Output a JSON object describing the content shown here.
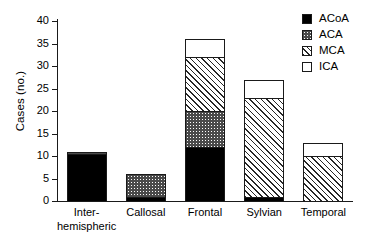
{
  "chart_data": {
    "type": "bar",
    "stacked": true,
    "title": "",
    "subtitle": "",
    "xlabel": "",
    "ylabel": "Cases (no.)",
    "categories": [
      "Inter-\nhemispheric",
      "Callosal",
      "Frontal",
      "Sylvian",
      "Temporal"
    ],
    "series": [
      {
        "name": "ACoA",
        "values": [
          10.5,
          1,
          12,
          1,
          0
        ]
      },
      {
        "name": "ACA",
        "values": [
          0.5,
          5,
          8,
          0,
          0
        ]
      },
      {
        "name": "MCA",
        "values": [
          0,
          0,
          12,
          22,
          10
        ]
      },
      {
        "name": "ICA",
        "values": [
          0,
          0,
          4,
          4,
          3
        ]
      }
    ],
    "totals": [
      11,
      6,
      36,
      27,
      13
    ],
    "ylim": [
      0,
      40
    ],
    "yticks": [
      0,
      5,
      10,
      15,
      20,
      25,
      30,
      35,
      40
    ],
    "ytick_labels": [
      "0",
      "5",
      "10",
      "15",
      "20",
      "25",
      "30",
      "35",
      "40"
    ],
    "grid": false,
    "legend_position": "top-right",
    "legend_entries": [
      {
        "label": "ACoA",
        "pattern": "solid-black",
        "color": "#000000"
      },
      {
        "label": "ACA",
        "pattern": "stipple-checker",
        "color": "#4a4a4a"
      },
      {
        "label": "MCA",
        "pattern": "diagonal-hatch",
        "color": "#262626"
      },
      {
        "label": "ICA",
        "pattern": "empty-white",
        "color": "#ffffff"
      }
    ]
  },
  "axes": {
    "y_title": "Cases (no.)",
    "ticks": [
      {
        "label": "40",
        "value": 40
      },
      {
        "label": "35",
        "value": 35
      },
      {
        "label": "30",
        "value": 30
      },
      {
        "label": "25",
        "value": 25
      },
      {
        "label": "20",
        "value": 20
      },
      {
        "label": "15",
        "value": 15
      },
      {
        "label": "10",
        "value": 10
      },
      {
        "label": "5",
        "value": 5
      },
      {
        "label": "0",
        "value": 0
      }
    ]
  }
}
